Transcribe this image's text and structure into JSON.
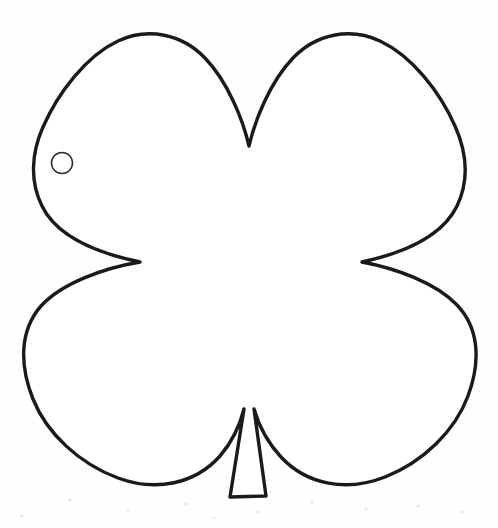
{
  "page": {
    "background_color": "#fefefe",
    "width": 498,
    "height": 528,
    "caption": ""
  },
  "artwork": {
    "name": "four-leaf-clover-outline",
    "description": "Hand-drawn black outline of a four leaf clover with a stem, drawn on white paper",
    "stroke_color": "#1a1a1a",
    "fill_color": "#ffffff",
    "stroke_width": 3.4,
    "style": "coloring-page line art",
    "leaf_count": 4,
    "has_stem": true,
    "has_punch_hole": true
  },
  "shape_geometry": {
    "outline_path": "M 249 146 C 243 120 228 82 205 58 C 182 34 148 27 118 41 C 86 56 58 93 43 127 C 31 154 30 182 42 206 C 56 235 92 252 140 262 C 104 268 62 283 41 306 C 20 330 19 364 33 399 C 47 434 80 464 118 478 C 156 492 195 484 220 456 C 232 442 240 425 244 409 L 230 497 L 266 496 L 254 409 C 259 426 268 443 281 457 C 307 485 347 492 385 477 C 423 462 455 431 468 396 C 481 361 479 328 457 305 C 435 282 394 268 362 262 C 408 252 443 235 457 206 C 469 181 467 153 455 126 C 440 92 412 56 380 41 C 350 27 316 34 293 58 C 270 82 255 120 249 146 Z",
    "hole": {
      "cx": 62,
      "cy": 163,
      "r": 10.5
    },
    "bounds": {
      "left": 22,
      "top": 32,
      "right": 469,
      "bottom": 505
    },
    "notches": {
      "top": {
        "x": 249,
        "y": 146
      },
      "left": {
        "x": 140,
        "y": 262
      },
      "right": {
        "x": 362,
        "y": 262
      }
    },
    "stem": {
      "top_left": {
        "x": 242,
        "y": 409
      },
      "top_right": {
        "x": 254,
        "y": 409
      },
      "bottom_left": {
        "x": 230,
        "y": 497
      },
      "bottom_right": {
        "x": 266,
        "y": 496
      }
    },
    "speckles": [
      {
        "x": 70,
        "y": 18,
        "r": 1.6
      },
      {
        "x": 128,
        "y": 28,
        "r": 1.3
      },
      {
        "x": 186,
        "y": 22,
        "r": 1.7
      },
      {
        "x": 258,
        "y": 30,
        "r": 1.4
      },
      {
        "x": 312,
        "y": 20,
        "r": 1.6
      },
      {
        "x": 366,
        "y": 27,
        "r": 1.2
      },
      {
        "x": 418,
        "y": 24,
        "r": 1.5
      },
      {
        "x": 462,
        "y": 30,
        "r": 1.3
      },
      {
        "x": 22,
        "y": 34,
        "r": 1.4
      },
      {
        "x": 214,
        "y": 36,
        "r": 1.1
      }
    ]
  }
}
